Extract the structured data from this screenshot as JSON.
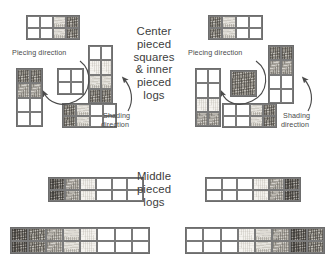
{
  "figure": {
    "center_caption": "Center\npieced\nsquares\n& inner\npieced\nlogs",
    "middle_caption": "Middle\npieced\nlogs"
  },
  "left_panel": {
    "piecing_label": "Piecing direction",
    "shading_label_line1": "Shading",
    "shading_label_line2": "direction",
    "blocks": [
      {
        "name": "top-strip",
        "cols": 4,
        "rows": 2,
        "x": 26,
        "y": 15,
        "w": 54,
        "h": 25,
        "cells": [
          [
            "f-white",
            "f-white",
            "f-light",
            "f-dark"
          ],
          [
            "f-white",
            "f-white",
            "f-light",
            "f-dark"
          ]
        ]
      },
      {
        "name": "left-vertical",
        "cols": 2,
        "rows": 4,
        "x": 16,
        "y": 68,
        "w": 27,
        "h": 59,
        "cells": [
          [
            "f-dark",
            "f-dark"
          ],
          [
            "f-med",
            "f-med"
          ],
          [
            "f-white",
            "f-white"
          ],
          [
            "f-white",
            "f-white"
          ]
        ]
      },
      {
        "name": "center-square",
        "cols": 2,
        "rows": 2,
        "x": 57,
        "y": 68,
        "w": 27,
        "h": 27,
        "cells": [
          [
            "f-white",
            "f-white"
          ],
          [
            "f-white",
            "f-white"
          ]
        ]
      },
      {
        "name": "right-vertical",
        "cols": 2,
        "rows": 4,
        "x": 88,
        "y": 45,
        "w": 25,
        "h": 59,
        "cells": [
          [
            "f-white",
            "f-white"
          ],
          [
            "f-cream",
            "f-cream"
          ],
          [
            "f-light",
            "f-light"
          ],
          [
            "f-dark",
            "f-dark"
          ]
        ]
      },
      {
        "name": "bottom-strip",
        "cols": 4,
        "rows": 2,
        "x": 62,
        "y": 103,
        "w": 55,
        "h": 25,
        "cells": [
          [
            "f-dark",
            "f-light",
            "f-white",
            "f-white"
          ],
          [
            "f-dark",
            "f-light",
            "f-white",
            "f-white"
          ]
        ]
      }
    ]
  },
  "right_panel": {
    "piecing_label": "Piecing direction",
    "shading_label_line1": "Shading",
    "shading_label_line2": "direction",
    "blocks": [
      {
        "name": "top-strip",
        "cols": 4,
        "rows": 2,
        "x": 208,
        "y": 15,
        "w": 55,
        "h": 25,
        "cells": [
          [
            "f-dark",
            "f-light",
            "f-white",
            "f-white"
          ],
          [
            "f-dark",
            "f-light",
            "f-white",
            "f-white"
          ]
        ]
      },
      {
        "name": "left-vertical",
        "cols": 2,
        "rows": 4,
        "x": 195,
        "y": 68,
        "w": 26,
        "h": 59,
        "cells": [
          [
            "f-white",
            "f-white"
          ],
          [
            "f-white",
            "f-white"
          ],
          [
            "f-cream",
            "f-cream"
          ],
          [
            "f-med",
            "f-med"
          ]
        ]
      },
      {
        "name": "center-square",
        "cols": 1,
        "rows": 1,
        "x": 230,
        "y": 70,
        "w": 27,
        "h": 27,
        "cells": [
          [
            "f-dark"
          ]
        ]
      },
      {
        "name": "right-vertical",
        "cols": 2,
        "rows": 4,
        "x": 268,
        "y": 45,
        "w": 26,
        "h": 59,
        "cells": [
          [
            "f-dark",
            "f-dark"
          ],
          [
            "f-med",
            "f-med"
          ],
          [
            "f-white",
            "f-white"
          ],
          [
            "f-white",
            "f-white"
          ]
        ]
      },
      {
        "name": "bottom-strip",
        "cols": 4,
        "rows": 2,
        "x": 222,
        "y": 103,
        "w": 55,
        "h": 25,
        "cells": [
          [
            "f-white",
            "f-white",
            "f-light",
            "f-dark"
          ],
          [
            "f-white",
            "f-white",
            "f-light",
            "f-dark"
          ]
        ]
      }
    ]
  },
  "middle_row": {
    "direction_word_left": "direction",
    "direction_word_right": "direction",
    "blocks": [
      {
        "name": "middle-left-strip",
        "cols": 6,
        "rows": 2,
        "x": 48,
        "y": 177,
        "w": 96,
        "h": 25,
        "cells": [
          [
            "f-vdark",
            "f-med",
            "f-cream",
            "f-white",
            "f-white",
            "f-white"
          ],
          [
            "f-vdark",
            "f-med",
            "f-cream",
            "f-white",
            "f-white",
            "f-white"
          ]
        ]
      },
      {
        "name": "middle-right-strip",
        "cols": 6,
        "rows": 2,
        "x": 205,
        "y": 177,
        "w": 96,
        "h": 25,
        "cells": [
          [
            "f-white",
            "f-white",
            "f-white",
            "f-cream",
            "f-med",
            "f-vdark"
          ],
          [
            "f-white",
            "f-white",
            "f-white",
            "f-cream",
            "f-med",
            "f-vdark"
          ]
        ]
      }
    ]
  },
  "bottom_row": {
    "blocks": [
      {
        "name": "bottom-left-strip",
        "cols": 8,
        "rows": 2,
        "x": 10,
        "y": 227,
        "w": 140,
        "h": 27,
        "cells": [
          [
            "f-vdark",
            "f-dark",
            "f-med",
            "f-light",
            "f-cream",
            "f-white",
            "f-white",
            "f-white"
          ],
          [
            "f-vdark",
            "f-dark",
            "f-med",
            "f-light",
            "f-cream",
            "f-white",
            "f-white",
            "f-white"
          ]
        ]
      },
      {
        "name": "bottom-right-strip",
        "cols": 8,
        "rows": 2,
        "x": 185,
        "y": 227,
        "w": 140,
        "h": 27,
        "cells": [
          [
            "f-white",
            "f-white",
            "f-white",
            "f-cream",
            "f-light",
            "f-med",
            "f-vdark",
            "f-dark"
          ],
          [
            "f-white",
            "f-white",
            "f-white",
            "f-cream",
            "f-light",
            "f-med",
            "f-vdark",
            "f-dark"
          ]
        ]
      }
    ]
  },
  "colors": {
    "ink": "#4a4a4a",
    "grid_line": "#7a7a7a",
    "arrow": "#555555",
    "background": "#ffffff"
  }
}
